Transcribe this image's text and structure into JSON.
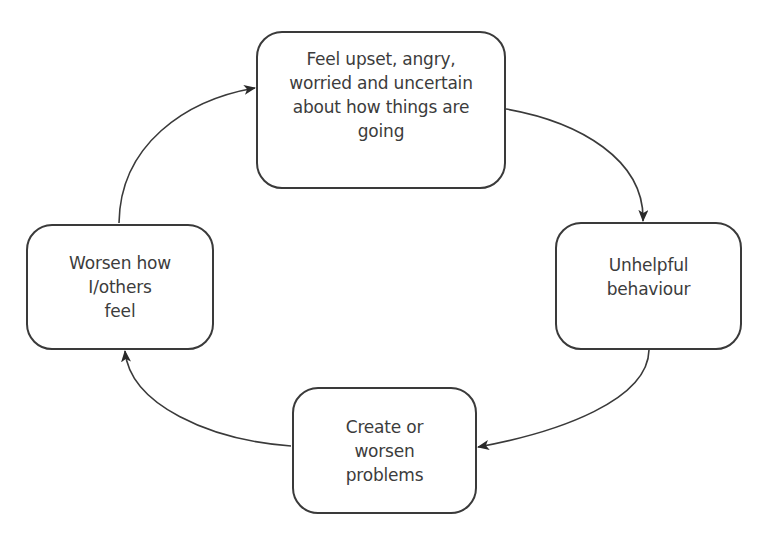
{
  "diagram": {
    "type": "cycle",
    "direction": "clockwise",
    "colors": {
      "stroke": "#3a3a3a",
      "text": "#3c3c3c",
      "background": "#ffffff"
    },
    "nodes": [
      {
        "id": "top",
        "label": "Feel upset, angry,\nworried and uncertain\nabout how things are\ngoing"
      },
      {
        "id": "right",
        "label": "Unhelpful\nbehaviour"
      },
      {
        "id": "bottom",
        "label": "Create or\nworsen\nproblems"
      },
      {
        "id": "left",
        "label": "Worsen how\nI/others\nfeel"
      }
    ],
    "edges": [
      {
        "from": "top",
        "to": "right"
      },
      {
        "from": "right",
        "to": "bottom"
      },
      {
        "from": "bottom",
        "to": "left"
      },
      {
        "from": "left",
        "to": "top"
      }
    ]
  }
}
